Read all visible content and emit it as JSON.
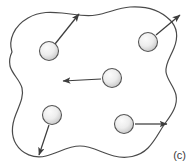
{
  "figure": {
    "panel_label": "(c)",
    "caption_position": "bottom-right",
    "background_color": "#ffffff",
    "boundary": {
      "name": "irregular-closed-region",
      "stroke_color": "#4a4a4a",
      "fill_color": "#ffffff",
      "stroke_width": 1.2,
      "path": "M 12 52 C 8 40 14 26 28 18 C 40 11 52 12 62 13 C 74 14 84 17 96 15 C 108 13 118 8 130 7 C 146 6 160 10 170 20 C 178 28 178 38 174 48 C 170 58 165 64 166 72 C 167 80 174 86 176 95 C 178 105 172 114 166 122 C 160 130 156 140 148 148 C 139 157 126 159 114 156 C 102 153 92 146 80 146 C 68 146 58 153 46 156 C 34 159 22 154 16 144 C 10 134 12 124 16 114 C 20 104 24 96 22 88 C 20 80 12 74 10 66 C 9 61 10 56 12 52 Z"
    },
    "particles": [
      {
        "id": "particle-top-left",
        "cx": 49,
        "cy": 51,
        "r": 9.5,
        "fill_light": "#f2f2f2",
        "fill_dark": "#c9c9c9",
        "stroke_color": "#555555",
        "arrow": {
          "id": "arrow-top-left",
          "x1": 55,
          "y1": 44,
          "x2": 79,
          "y2": 14,
          "direction": "up-right",
          "crosses_boundary": true,
          "color": "#3d3d3d"
        }
      },
      {
        "id": "particle-top-right",
        "cx": 148,
        "cy": 42,
        "r": 9.5,
        "fill_light": "#f2f2f2",
        "fill_dark": "#c9c9c9",
        "stroke_color": "#555555",
        "arrow": {
          "id": "arrow-top-right",
          "x1": 156,
          "y1": 35,
          "x2": 180,
          "y2": 15,
          "direction": "up-right",
          "crosses_boundary": true,
          "color": "#3d3d3d"
        }
      },
      {
        "id": "particle-center",
        "cx": 112,
        "cy": 78,
        "r": 9.5,
        "fill_light": "#f2f2f2",
        "fill_dark": "#c9c9c9",
        "stroke_color": "#555555",
        "arrow": {
          "id": "arrow-center",
          "x1": 101,
          "y1": 79,
          "x2": 63,
          "y2": 81,
          "direction": "left",
          "crosses_boundary": false,
          "color": "#3d3d3d"
        }
      },
      {
        "id": "particle-bottom-left",
        "cx": 52,
        "cy": 115,
        "r": 9.5,
        "fill_light": "#f2f2f2",
        "fill_dark": "#c9c9c9",
        "stroke_color": "#555555",
        "arrow": {
          "id": "arrow-bottom-left",
          "x1": 49,
          "y1": 125,
          "x2": 39,
          "y2": 155,
          "direction": "down-left",
          "crosses_boundary": true,
          "color": "#3d3d3d"
        }
      },
      {
        "id": "particle-bottom-right",
        "cx": 124,
        "cy": 124,
        "r": 9.5,
        "fill_light": "#f2f2f2",
        "fill_dark": "#c9c9c9",
        "stroke_color": "#555555",
        "arrow": {
          "id": "arrow-bottom-right",
          "x1": 135,
          "y1": 124,
          "x2": 167,
          "y2": 124,
          "direction": "right",
          "crosses_boundary": true,
          "color": "#3d3d3d"
        }
      }
    ]
  }
}
